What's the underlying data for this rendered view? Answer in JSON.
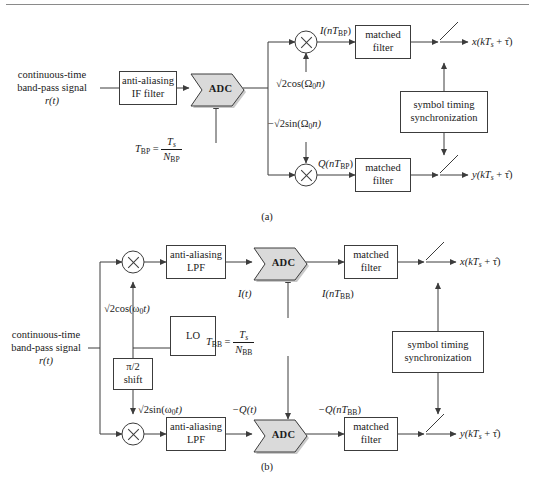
{
  "page": {
    "top_rule": true,
    "captions": {
      "a": "(a)",
      "b": "(b)"
    }
  },
  "diagram_a": {
    "input_label": {
      "line1": "continuous-time",
      "line2": "band-pass signal",
      "line3": "r(t)"
    },
    "blocks": {
      "antialias_if": {
        "line1": "anti-aliasing",
        "line2": "IF filter"
      },
      "adc": "ADC",
      "matched_filter_i": {
        "line1": "matched",
        "line2": "filter"
      },
      "matched_filter_q": {
        "line1": "matched",
        "line2": "filter"
      },
      "sync": {
        "line1": "symbol timing",
        "line2": "synchronization"
      }
    },
    "signals": {
      "clock": {
        "lhs": "T",
        "lhs_sub": "BP",
        "eq": "=",
        "num": "T",
        "num_sub": "s",
        "den": "N",
        "den_sub": "BP"
      },
      "carrier_i": {
        "radical": "√2",
        "body": "cos(Ω",
        "sub": "0",
        "tail": "n)"
      },
      "carrier_q": {
        "sign": "−",
        "radical": "√2",
        "body": "sin(Ω",
        "sub": "0",
        "tail": "n)"
      },
      "i_branch": {
        "pre": "I(nT",
        "sub": "BP",
        "post": ")"
      },
      "q_branch": {
        "pre": "Q(nT",
        "sub": "BP",
        "post": ")"
      },
      "out_x": {
        "pre": "x(kT",
        "sub": "s",
        "post": " + τ̂)"
      },
      "out_y": {
        "pre": "y(kT",
        "sub": "s",
        "post": " + τ̂)"
      }
    }
  },
  "diagram_b": {
    "input_label": {
      "line1": "continuous-time",
      "line2": "band-pass signal",
      "line3": "r(t)"
    },
    "blocks": {
      "antialias_lpf_i": {
        "line1": "anti-aliasing",
        "line2": "LPF"
      },
      "antialias_lpf_q": {
        "line1": "anti-aliasing",
        "line2": "LPF"
      },
      "adc_i": "ADC",
      "adc_q": "ADC",
      "matched_filter_i": {
        "line1": "matched",
        "line2": "filter"
      },
      "matched_filter_q": {
        "line1": "matched",
        "line2": "filter"
      },
      "lo": "LO",
      "phase_shift": {
        "line1": "π/2",
        "line2": "shift"
      },
      "sync": {
        "line1": "symbol timing",
        "line2": "synchronization"
      }
    },
    "signals": {
      "clock": {
        "lhs": "T",
        "lhs_sub": "BB",
        "eq": "=",
        "num": "T",
        "num_sub": "s",
        "den": "N",
        "den_sub": "BB"
      },
      "carrier_i": {
        "radical": "√2",
        "body": "cos(ω",
        "sub": "0",
        "tail": "t)"
      },
      "carrier_q": {
        "radical": "√2",
        "body": "sin(ω",
        "sub": "0",
        "tail": "t)"
      },
      "i_analog": "I(t)",
      "i_digital": {
        "pre": "I(nT",
        "sub": "BB",
        "post": ")"
      },
      "q_analog": {
        "pre": "−Q(t)"
      },
      "q_digital": {
        "pre": "−Q(nT",
        "sub": "BB",
        "post": ")"
      },
      "out_x": {
        "pre": "x(kT",
        "sub": "s",
        "post": " + τ̂)"
      },
      "out_y": {
        "pre": "y(kT",
        "sub": "s",
        "post": " + τ̂)"
      }
    }
  },
  "style": {
    "adc_fill": "#d4d4d4",
    "line_color": "#3c3c3c",
    "text_color": "#1a1a1a"
  }
}
